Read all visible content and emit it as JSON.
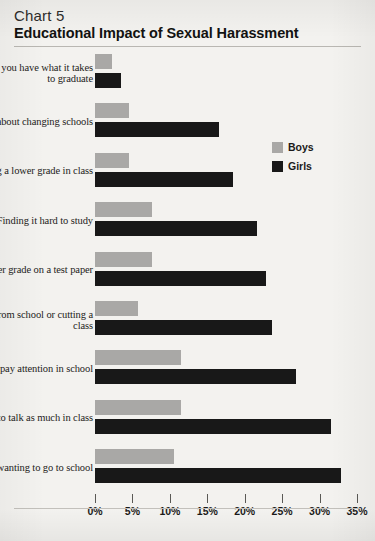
{
  "header": {
    "chart_number": "Chart 5",
    "title": "Educational Impact of Sexual Harassment"
  },
  "legend": {
    "items": [
      {
        "label": "Boys",
        "color": "#a9a8a6"
      },
      {
        "label": "Girls",
        "color": "#181818"
      }
    ]
  },
  "axis": {
    "ticks": [
      "0%",
      "5%",
      "10%",
      "15%",
      "20%",
      "25%",
      "30%",
      "35%"
    ]
  },
  "chart_data": {
    "type": "bar",
    "orientation": "horizontal",
    "title": "Educational Impact of Sexual Harassment",
    "subtitle": "Chart 5",
    "xlabel": "",
    "ylabel": "",
    "xlim": [
      0,
      35
    ],
    "xunit": "%",
    "xticks": [
      0,
      5,
      10,
      15,
      20,
      25,
      30,
      35
    ],
    "grid": false,
    "legend_position": "right-top",
    "categories": [
      "Doubting whether you have what it takes to graduate",
      "Thinking about changing schools",
      "Making a lower grade in class",
      "Finding it hard to study",
      "Making a lower grade on a test paper",
      "Staying home from school or cutting a class",
      "Finding it hard to pay attention in school",
      "Not wanting to talk as much in class",
      "Not wanting to go to school"
    ],
    "series": [
      {
        "name": "Boys",
        "color": "#a9a8a6",
        "values": [
          2.3,
          4.6,
          4.6,
          7.6,
          7.6,
          5.8,
          11.5,
          11.5,
          10.6
        ]
      },
      {
        "name": "Girls",
        "color": "#181818",
        "values": [
          3.5,
          16.6,
          18.4,
          21.7,
          22.8,
          23.7,
          26.8,
          31.5,
          32.8
        ]
      }
    ]
  }
}
